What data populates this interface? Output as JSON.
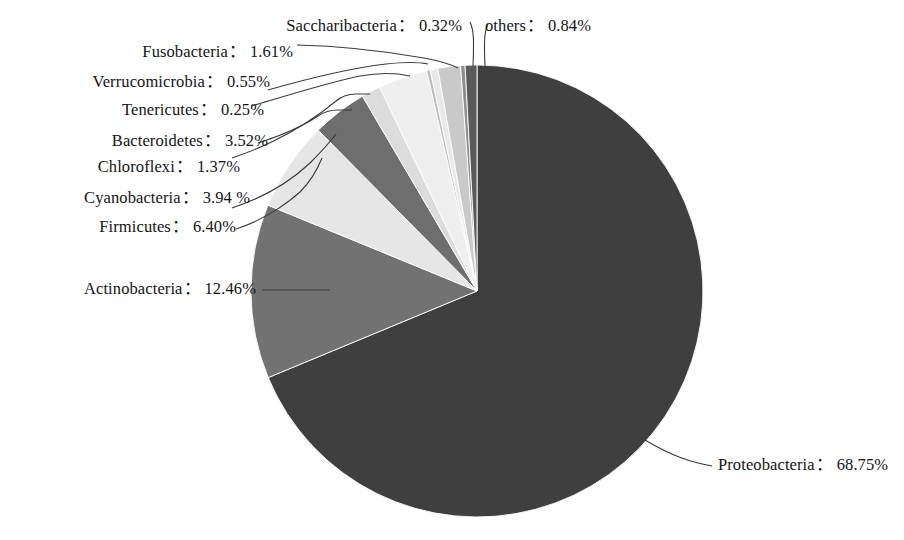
{
  "chart_data": {
    "type": "pie",
    "title": "",
    "subtitle": "",
    "xlabel": "",
    "ylabel": "",
    "legend_position": "none",
    "grid": false,
    "units": "%",
    "separator": "：",
    "start_angle_deg": 0,
    "direction": "clockwise",
    "categories": [
      "Proteobacteria",
      "Actinobacteria",
      "Firmicutes",
      "Cyanobacteria",
      "Chloroflexi",
      "Bacteroidetes",
      "Tenericutes",
      "Verrucomicrobia",
      "Fusobacteria",
      "Saccharibacteria",
      "others"
    ],
    "values": [
      68.75,
      12.46,
      6.4,
      3.94,
      1.37,
      3.52,
      0.25,
      0.55,
      1.61,
      0.32,
      0.84
    ],
    "value_labels": [
      "68.75%",
      "12.46%",
      "6.40%",
      "3.94 %",
      "1.37%",
      "3.52%",
      "0.25%",
      "0.55%",
      "1.61%",
      "0.32%",
      "0.84%"
    ],
    "colors": [
      "#3f3f3f",
      "#727272",
      "#e6e6e6",
      "#6e6e6e",
      "#dcdcdc",
      "#efefef",
      "#bdbdbd",
      "#e9e9e9",
      "#c9c9c9",
      "#8e8e8e",
      "#5a5a5a"
    ],
    "slices": [
      {
        "name": "Proteobacteria",
        "value": 68.75,
        "value_label": "68.75%",
        "color": "#3f3f3f"
      },
      {
        "name": "Actinobacteria",
        "value": 12.46,
        "value_label": "12.46%",
        "color": "#727272"
      },
      {
        "name": "Firmicutes",
        "value": 6.4,
        "value_label": "6.40%",
        "color": "#e6e6e6"
      },
      {
        "name": "Cyanobacteria",
        "value": 3.94,
        "value_label": "3.94 %",
        "color": "#6e6e6e"
      },
      {
        "name": "Chloroflexi",
        "value": 1.37,
        "value_label": "1.37%",
        "color": "#dcdcdc"
      },
      {
        "name": "Bacteroidetes",
        "value": 3.52,
        "value_label": "3.52%",
        "color": "#efefef"
      },
      {
        "name": "Tenericutes",
        "value": 0.25,
        "value_label": "0.25%",
        "color": "#bdbdbd"
      },
      {
        "name": "Verrucomicrobia",
        "value": 0.55,
        "value_label": "0.55%",
        "color": "#e9e9e9"
      },
      {
        "name": "Fusobacteria",
        "value": 1.61,
        "value_label": "1.61%",
        "color": "#c9c9c9"
      },
      {
        "name": "Saccharibacteria",
        "value": 0.32,
        "value_label": "0.32%",
        "color": "#8e8e8e"
      },
      {
        "name": "others",
        "value": 0.84,
        "value_label": "0.84%",
        "color": "#5a5a5a"
      }
    ]
  },
  "labels": {
    "saccharibacteria": {
      "name": "Saccharibacteria",
      "sep": "：",
      "value": "0.32%"
    },
    "others": {
      "name": "others",
      "sep": "：",
      "value": "0.84%"
    },
    "fusobacteria": {
      "name": "Fusobacteria",
      "sep": "：",
      "value": "1.61%"
    },
    "verrucomicrobia": {
      "name": "Verrucomicrobia",
      "sep": "：",
      "value": "0.55%"
    },
    "tenericutes": {
      "name": "Tenericutes",
      "sep": "：",
      "value": "0.25%"
    },
    "bacteroidetes": {
      "name": "Bacteroidetes",
      "sep": "：",
      "value": "3.52%"
    },
    "chloroflexi": {
      "name": "Chloroflexi",
      "sep": "：",
      "value": "1.37%"
    },
    "cyanobacteria": {
      "name": "Cyanobacteria",
      "sep": "：",
      "value": "3.94 %"
    },
    "firmicutes": {
      "name": "Firmicutes",
      "sep": "：",
      "value": "6.40%"
    },
    "actinobacteria": {
      "name": "Actinobacteria",
      "sep": "：",
      "value": "12.46%"
    },
    "proteobacteria": {
      "name": "Proteobacteria",
      "sep": "：",
      "value": "68.75%"
    }
  }
}
